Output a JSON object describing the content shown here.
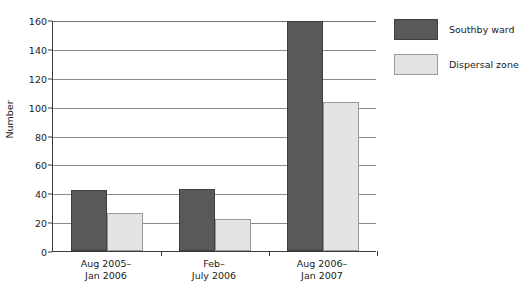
{
  "chart_data": {
    "type": "bar",
    "title": "",
    "xlabel": "",
    "ylabel": "Number",
    "ylim": [
      0,
      160
    ],
    "ytick_step": 20,
    "yticks": [
      0,
      20,
      40,
      60,
      80,
      100,
      120,
      140,
      160
    ],
    "grid": true,
    "legend_position": "right",
    "categories": [
      "Aug 2005–\nJan 2006",
      "Feb–\nJuly 2006",
      "Aug 2006–\nJan 2007"
    ],
    "series": [
      {
        "name": "Southby ward",
        "color": "#595959",
        "values": [
          42,
          43,
          159
        ]
      },
      {
        "name": "Dispersal zone",
        "color": "#e3e3e3",
        "values": [
          26,
          22,
          103
        ]
      }
    ]
  },
  "colors": {
    "series_dark": "#595959",
    "series_light": "#e3e3e3",
    "axis": "#3a3a3a",
    "gridline": "#8a8a8a",
    "background": "#ffffff"
  }
}
